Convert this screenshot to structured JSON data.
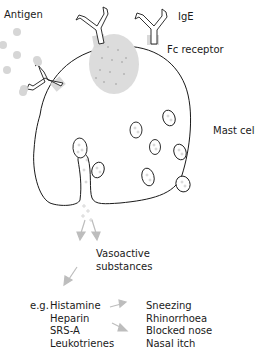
{
  "labels": {
    "antigen": "Antigen",
    "ige": "IgE",
    "fc_receptor": "Fc receptor",
    "mast_cell": "Mast cell",
    "vasoactive_line1": "Vasoactive",
    "vasoactive_line2": "substances"
  },
  "mediators": {
    "prefix": "e.g.",
    "items": [
      "Histamine",
      "Heparin",
      "SRS-A",
      "Leukotrienes"
    ]
  },
  "symptoms": {
    "items": [
      "Sneezing",
      "Rhinorrhoea",
      "Blocked nose",
      "Nasal itch"
    ]
  },
  "colors": {
    "outline": "#1a1a1a",
    "grey_fill": "#d9d9d9",
    "antigen_dot": "#d6d6d6",
    "arrow": "#bdbdbd"
  }
}
